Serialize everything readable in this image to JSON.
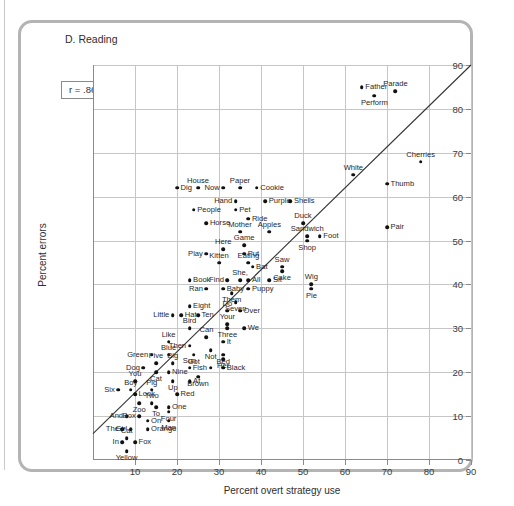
{
  "figure": {
    "panel_title": "D. Reading",
    "annotation": "r = .86",
    "xlabel": "Percent overt strategy use",
    "ylabel": "Percent errors"
  },
  "chart_data": {
    "type": "scatter",
    "title": "D. Reading",
    "xlabel": "Percent overt strategy use",
    "ylabel": "Percent errors",
    "xlim": [
      0,
      90
    ],
    "ylim": [
      0,
      90
    ],
    "xticks": [
      10,
      20,
      30,
      40,
      50,
      60,
      70,
      80,
      90
    ],
    "yticks": [
      0,
      10,
      20,
      30,
      40,
      50,
      60,
      70,
      80,
      90
    ],
    "grid": true,
    "legend": "none",
    "annotations": [
      {
        "text": "r = .86",
        "x": 8,
        "y": 75
      }
    ],
    "correlation": 0.86,
    "trendline": {
      "x0": 0,
      "y0": 6,
      "x1": 90,
      "y1": 90
    },
    "point_label_key": "word",
    "points": [
      {
        "word": "Father",
        "x": 64,
        "y": 85,
        "lp": "l"
      },
      {
        "word": "Parade",
        "x": 72,
        "y": 84,
        "lp": "above"
      },
      {
        "word": "Perform",
        "x": 67,
        "y": 83,
        "lp": "below"
      },
      {
        "word": "Cherries",
        "x": 78,
        "y": 68,
        "lp": "above"
      },
      {
        "word": "White",
        "x": 62,
        "y": 65,
        "lp": "above"
      },
      {
        "word": "Thumb",
        "x": 70,
        "y": 63,
        "lp": "l"
      },
      {
        "word": "Dig",
        "x": 20,
        "y": 62,
        "lp": "l"
      },
      {
        "word": "House",
        "x": 25,
        "y": 62,
        "lp": "above"
      },
      {
        "word": "Now",
        "x": 31,
        "y": 62,
        "lp": "r"
      },
      {
        "word": "Paper",
        "x": 35,
        "y": 62,
        "lp": "above"
      },
      {
        "word": "Cookie",
        "x": 39,
        "y": 62,
        "lp": "l"
      },
      {
        "word": "Hand",
        "x": 34,
        "y": 59,
        "lp": "r"
      },
      {
        "word": "Purple",
        "x": 41,
        "y": 59,
        "lp": "l"
      },
      {
        "word": "Shells",
        "x": 47,
        "y": 59,
        "lp": "l"
      },
      {
        "word": "People",
        "x": 24,
        "y": 57,
        "lp": "l"
      },
      {
        "word": "Pet",
        "x": 34,
        "y": 57,
        "lp": "l"
      },
      {
        "word": "Ride",
        "x": 37,
        "y": 55,
        "lp": "l"
      },
      {
        "word": "Horse",
        "x": 27,
        "y": 54,
        "lp": "l"
      },
      {
        "word": "Duck",
        "x": 50,
        "y": 54,
        "lp": "above"
      },
      {
        "word": "Mother",
        "x": 35,
        "y": 52,
        "lp": "above"
      },
      {
        "word": "Apples",
        "x": 42,
        "y": 52,
        "lp": "above"
      },
      {
        "word": "Pair",
        "x": 70,
        "y": 53,
        "lp": "l"
      },
      {
        "word": "Sandwich",
        "x": 51,
        "y": 51,
        "lp": "above"
      },
      {
        "word": "Foot",
        "x": 54,
        "y": 51,
        "lp": "l"
      },
      {
        "word": "Shop",
        "x": 51,
        "y": 50,
        "lp": "below"
      },
      {
        "word": "Game",
        "x": 36,
        "y": 49,
        "lp": "above"
      },
      {
        "word": "Here",
        "x": 31,
        "y": 48,
        "lp": "above"
      },
      {
        "word": "Play",
        "x": 27,
        "y": 47,
        "lp": "r"
      },
      {
        "word": "Put",
        "x": 36,
        "y": 47,
        "lp": "l"
      },
      {
        "word": "Kitten",
        "x": 30,
        "y": 45,
        "lp": "above"
      },
      {
        "word": "Eating",
        "x": 37,
        "y": 45,
        "lp": "above"
      },
      {
        "word": "Bat",
        "x": 38,
        "y": 44,
        "lp": "l"
      },
      {
        "word": "Saw",
        "x": 45,
        "y": 44,
        "lp": "above"
      },
      {
        "word": "Cake",
        "x": 45,
        "y": 43,
        "lp": "below"
      },
      {
        "word": "Find",
        "x": 32,
        "y": 41,
        "lp": "r"
      },
      {
        "word": "She,",
        "x": 35,
        "y": 41,
        "lp": "above"
      },
      {
        "word": "All",
        "x": 37,
        "y": 41,
        "lp": "l"
      },
      {
        "word": "Sit",
        "x": 42,
        "y": 41,
        "lp": "l"
      },
      {
        "word": "Book",
        "x": 23,
        "y": 41,
        "lp": "l"
      },
      {
        "word": "Wig",
        "x": 52,
        "y": 40,
        "lp": "above"
      },
      {
        "word": "Pie",
        "x": 52,
        "y": 39,
        "lp": "below"
      },
      {
        "word": "Ran",
        "x": 27,
        "y": 39,
        "lp": "r"
      },
      {
        "word": "Baby",
        "x": 31,
        "y": 39,
        "lp": "l"
      },
      {
        "word": "Puppy",
        "x": 37,
        "y": 39,
        "lp": "l"
      },
      {
        "word": "Them",
        "x": 33,
        "y": 38,
        "lp": "below"
      },
      {
        "word": "Eight",
        "x": 23,
        "y": 35,
        "lp": "l"
      },
      {
        "word": "Seven",
        "x": 34,
        "y": 36,
        "lp": "below"
      },
      {
        "word": "Do",
        "x": 32,
        "y": 34,
        "lp": "above"
      },
      {
        "word": "Over",
        "x": 35,
        "y": 34,
        "lp": "l"
      },
      {
        "word": "Little",
        "x": 19,
        "y": 33,
        "lp": "r"
      },
      {
        "word": "Hat",
        "x": 21,
        "y": 33,
        "lp": "l"
      },
      {
        "word": "Ten",
        "x": 25,
        "y": 33,
        "lp": "l"
      },
      {
        "word": "Your",
        "x": 32,
        "y": 31,
        "lp": "above"
      },
      {
        "word": "Three",
        "x": 32,
        "y": 30,
        "lp": "below"
      },
      {
        "word": "We",
        "x": 36,
        "y": 30,
        "lp": "l"
      },
      {
        "word": "Bird",
        "x": 23,
        "y": 30,
        "lp": "above"
      },
      {
        "word": "Like",
        "x": 18,
        "y": 27,
        "lp": "above"
      },
      {
        "word": "Can",
        "x": 27,
        "y": 28,
        "lp": "above"
      },
      {
        "word": "It",
        "x": 31,
        "y": 27,
        "lp": "l"
      },
      {
        "word": "Then",
        "x": 23,
        "y": 26,
        "lp": "r"
      },
      {
        "word": "Not",
        "x": 28,
        "y": 25,
        "lp": "below"
      },
      {
        "word": "Bed",
        "x": 31,
        "y": 24,
        "lp": "below"
      },
      {
        "word": "Got",
        "x": 24,
        "y": 24,
        "lp": "below"
      },
      {
        "word": "Green",
        "x": 14,
        "y": 24,
        "lp": "r"
      },
      {
        "word": "Blue",
        "x": 18,
        "y": 24,
        "lp": "above"
      },
      {
        "word": "Her",
        "x": 31,
        "y": 23,
        "lp": "below"
      },
      {
        "word": "Five",
        "x": 15,
        "y": 22,
        "lp": "above"
      },
      {
        "word": "Big",
        "x": 19,
        "y": 22,
        "lp": "above"
      },
      {
        "word": "Sun",
        "x": 23,
        "y": 21,
        "lp": "above"
      },
      {
        "word": "Dog",
        "x": 12,
        "y": 21,
        "lp": "r"
      },
      {
        "word": "Cat",
        "x": 15,
        "y": 20,
        "lp": "below"
      },
      {
        "word": "Nine",
        "x": 18,
        "y": 20,
        "lp": "l"
      },
      {
        "word": "Fish",
        "x": 28,
        "y": 21,
        "lp": "r"
      },
      {
        "word": "Black",
        "x": 31,
        "y": 21,
        "lp": "l"
      },
      {
        "word": "You",
        "x": 10,
        "y": 18,
        "lp": "above"
      },
      {
        "word": "Brown",
        "x": 25,
        "y": 19,
        "lp": "below"
      },
      {
        "word": "Up",
        "x": 19,
        "y": 18,
        "lp": "below"
      },
      {
        "word": "At",
        "x": 23,
        "y": 18,
        "lp": "l"
      },
      {
        "word": "Six",
        "x": 6,
        "y": 16,
        "lp": "r"
      },
      {
        "word": "Boy",
        "x": 9,
        "y": 16,
        "lp": "above"
      },
      {
        "word": "Pig",
        "x": 14,
        "y": 16,
        "lp": "above"
      },
      {
        "word": "Look",
        "x": 10,
        "y": 15,
        "lp": "l"
      },
      {
        "word": "Red",
        "x": 20,
        "y": 15,
        "lp": "l"
      },
      {
        "word": "Zoo",
        "x": 11,
        "y": 13,
        "lp": "below"
      },
      {
        "word": "Two",
        "x": 14,
        "y": 13,
        "lp": "above"
      },
      {
        "word": "To",
        "x": 15,
        "y": 12,
        "lp": "below"
      },
      {
        "word": "One",
        "x": 18,
        "y": 12,
        "lp": "l"
      },
      {
        "word": "And",
        "x": 8,
        "y": 10,
        "lp": "r"
      },
      {
        "word": "Box",
        "x": 11,
        "y": 10,
        "lp": "r"
      },
      {
        "word": "Four",
        "x": 18,
        "y": 11,
        "lp": "below"
      },
      {
        "word": "On",
        "x": 13,
        "y": 9,
        "lp": "l"
      },
      {
        "word": "Man",
        "x": 18,
        "y": 9,
        "lp": "below"
      },
      {
        "word": "The",
        "x": 7,
        "y": 7,
        "lp": "r"
      },
      {
        "word": "Girl",
        "x": 9,
        "y": 7,
        "lp": "r"
      },
      {
        "word": "Orange",
        "x": 13,
        "y": 7,
        "lp": "l"
      },
      {
        "word": "Cat",
        "x": 8,
        "y": 5,
        "lp": "above"
      },
      {
        "word": "In",
        "x": 7,
        "y": 4,
        "lp": "r"
      },
      {
        "word": "Fox",
        "x": 10,
        "y": 4,
        "lp": "l"
      },
      {
        "word": "Yellow",
        "x": 8,
        "y": 2,
        "lp": "below"
      }
    ]
  }
}
